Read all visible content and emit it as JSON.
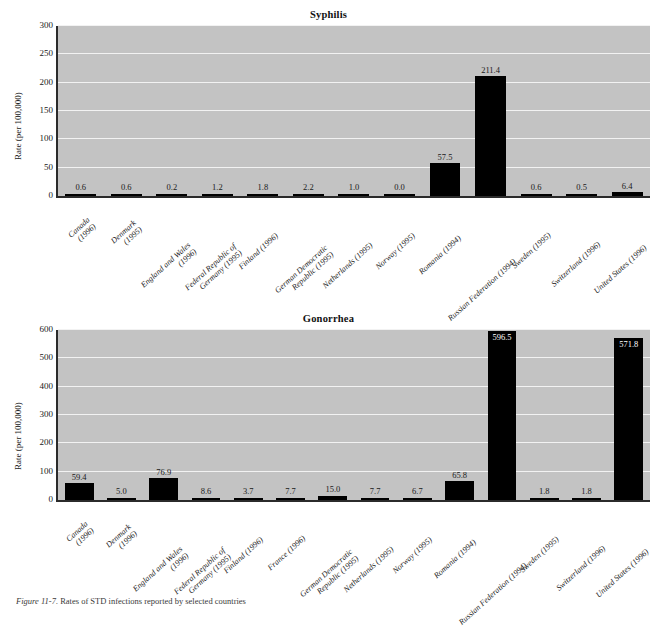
{
  "figure": {
    "caption_number": "Figure 11-7.",
    "caption_text": "Rates of STD infections reported by selected countries"
  },
  "chart_data": [
    {
      "type": "bar",
      "title": "Syphilis",
      "xlabel": "",
      "ylabel": "Rate (per 100,000)",
      "ylim": [
        0,
        300
      ],
      "yticks": [
        0,
        50,
        100,
        150,
        200,
        250,
        300
      ],
      "grid": true,
      "legend": "none",
      "bar_color": "#000000",
      "plot_background": "#c3c3c3",
      "categories": [
        "Canada (1996)",
        "Denmark (1995)",
        "England and Wales (1996)",
        "Federal Republic of Germany (1995)",
        "Finland (1996)",
        "German Democratic Republic (1995)",
        "Netherlands (1995)",
        "Norway (1995)",
        "Romania (1994)",
        "Russian Federation (1994)",
        "Sweden (1995)",
        "Switzerland (1996)",
        "United States (1996)"
      ],
      "category_lines": [
        [
          "Canada",
          "(1996)"
        ],
        [
          "Denmark",
          "(1995)"
        ],
        [
          "England and Wales",
          "(1996)"
        ],
        [
          "Federal Republic of",
          "Germany (1995)"
        ],
        [
          "Finland (1996)"
        ],
        [
          "German Democratic",
          "Republic (1995)"
        ],
        [
          "Netherlands (1995)"
        ],
        [
          "Norway (1995)"
        ],
        [
          "Romania (1994)"
        ],
        [
          "Russian Federation (1994)"
        ],
        [
          "Sweden (1995)"
        ],
        [
          "Switzerland (1996)"
        ],
        [
          "United States (1996)"
        ]
      ],
      "values": [
        0.6,
        0.6,
        0.2,
        1.2,
        1.8,
        2.2,
        1.0,
        0.0,
        57.5,
        211.4,
        0.6,
        0.5,
        6.4
      ],
      "value_labels": [
        "0.6",
        "0.6",
        "0.2",
        "1.2",
        "1.8",
        "2.2",
        "1.0",
        "0.0",
        "57.5",
        "211.4",
        "0.6",
        "0.5",
        "6.4"
      ],
      "label_placement": [
        "outside",
        "outside",
        "outside",
        "outside",
        "outside",
        "outside",
        "outside",
        "outside",
        "outside",
        "outside",
        "outside",
        "outside",
        "outside"
      ]
    },
    {
      "type": "bar",
      "title": "Gonorrhea",
      "xlabel": "",
      "ylabel": "Rate (per 100,000)",
      "ylim": [
        0,
        600
      ],
      "yticks": [
        0,
        100,
        200,
        300,
        400,
        500,
        600
      ],
      "grid": true,
      "legend": "none",
      "bar_color": "#000000",
      "plot_background": "#c3c3c3",
      "categories": [
        "Canada (1996)",
        "Denmark (1996)",
        "England and Wales (1996)",
        "Federal Republic of Germany (1995)",
        "Finland (1996)",
        "France (1996)",
        "German Democratic Republic (1995)",
        "Netherlands (1995)",
        "Norway (1995)",
        "Romania (1994)",
        "Russian Federation (1994)",
        "Sweden (1995)",
        "Switzerland (1996)",
        "United States (1996)"
      ],
      "category_lines": [
        [
          "Canada",
          "(1996)"
        ],
        [
          "Denmark",
          "(1996)"
        ],
        [
          "England and Wales",
          "(1996)"
        ],
        [
          "Federal Republic of",
          "Germany (1995)"
        ],
        [
          "Finland (1996)"
        ],
        [
          "France (1996)"
        ],
        [
          "German Democratic",
          "Republic (1995)"
        ],
        [
          "Netherlands (1995)"
        ],
        [
          "Norway (1995)"
        ],
        [
          "Romania (1994)"
        ],
        [
          "Russian Federation (1994)"
        ],
        [
          "Sweden (1995)"
        ],
        [
          "Switzerland (1996)"
        ],
        [
          "United States (1996)"
        ]
      ],
      "values": [
        59.4,
        5.0,
        76.9,
        8.6,
        3.7,
        7.7,
        15.0,
        7.7,
        6.7,
        65.8,
        596.5,
        1.8,
        1.8,
        571.8
      ],
      "value_labels": [
        "59.4",
        "5.0",
        "76.9",
        "8.6",
        "3.7",
        "7.7",
        "15.0",
        "7.7",
        "6.7",
        "65.8",
        "596.5",
        "1.8",
        "1.8",
        "571.8"
      ],
      "label_placement": [
        "outside",
        "outside",
        "outside",
        "outside",
        "outside",
        "outside",
        "outside",
        "outside",
        "outside",
        "outside",
        "inside",
        "outside",
        "outside",
        "inside"
      ]
    }
  ]
}
